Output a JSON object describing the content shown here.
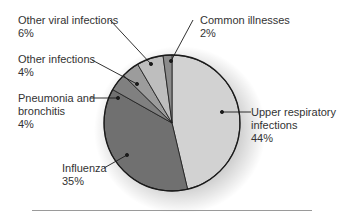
{
  "chart_data": {
    "type": "pie",
    "title": "",
    "center": [
      172,
      123
    ],
    "radius": 68,
    "start_angle_deg": 0,
    "direction": "clockwise",
    "slices": [
      {
        "label": "Upper respiratory infections",
        "value": 44,
        "color": "#d2d2d2"
      },
      {
        "label": "Influenza",
        "value": 35,
        "color": "#707070"
      },
      {
        "label": "Pneumonia and bronchitis",
        "value": 4,
        "color": "#808080"
      },
      {
        "label": "Other infections",
        "value": 4,
        "color": "#9c9c9c"
      },
      {
        "label": "Other viral infections",
        "value": 6,
        "color": "#bebebe"
      },
      {
        "label": "Common illnesses",
        "value": 2,
        "color": "#8c8c8c"
      }
    ]
  },
  "labels": {
    "other_viral": {
      "line1": "Other viral infections",
      "line2": "6%"
    },
    "common": {
      "line1": "Common illnesses",
      "line2": "2%"
    },
    "other_inf": {
      "line1": "Other infections",
      "line2": "4%"
    },
    "pneumonia": {
      "line1": "Pneumonia and",
      "line2": "bronchitis",
      "line3": "4%"
    },
    "upper": {
      "line1": "Upper respiratory",
      "line2": "infections",
      "line3": "44%"
    },
    "influenza": {
      "line1": "Influenza",
      "line2": "35%"
    }
  }
}
